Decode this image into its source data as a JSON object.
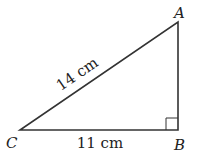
{
  "figure": {
    "type": "right-triangle",
    "vertices": {
      "A": {
        "label": "A",
        "x": 178,
        "y": 22
      },
      "B": {
        "label": "B",
        "x": 178,
        "y": 130
      },
      "C": {
        "label": "C",
        "x": 20,
        "y": 130
      }
    },
    "right_angle_at": "B",
    "sides": {
      "hypotenuse": {
        "from": "C",
        "to": "A",
        "label": "14 cm"
      },
      "base": {
        "from": "C",
        "to": "B",
        "label": "11 cm"
      }
    },
    "colors": {
      "stroke": "#333333",
      "text": "#222222",
      "background": "#ffffff"
    }
  }
}
